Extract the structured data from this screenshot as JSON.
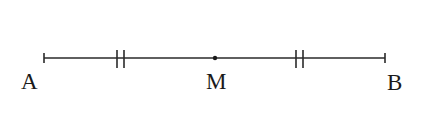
{
  "diagram": {
    "type": "line-segment-midpoint",
    "segment": {
      "from": "A",
      "to": "B"
    },
    "points": [
      {
        "label": "A",
        "x": 44,
        "label_x": 30
      },
      {
        "label": "M",
        "x": 215,
        "label_x": 218
      },
      {
        "label": "B",
        "x": 385,
        "label_x": 396
      }
    ],
    "congruence_marks": [
      {
        "segment": "AM",
        "ticks": 2,
        "x": 120
      },
      {
        "segment": "MB",
        "ticks": 2,
        "x": 299
      }
    ],
    "colors": {
      "stroke": "#2a2a2a",
      "text": "#1a1a1a",
      "background": "#ffffff"
    }
  },
  "labels": {
    "a": "A",
    "m": "M",
    "b": "B"
  }
}
